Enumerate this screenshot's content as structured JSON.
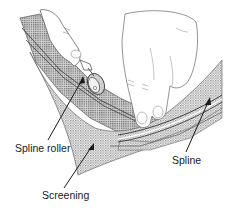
{
  "diagram": {
    "labels": [
      {
        "id": "spline-roller",
        "text": "Spline roller"
      },
      {
        "id": "screening",
        "text": "Screening"
      },
      {
        "id": "spline",
        "text": "Spline"
      }
    ],
    "colors": {
      "line": "#333333",
      "mesh": "#9a9a9a",
      "background": "#ffffff"
    }
  }
}
